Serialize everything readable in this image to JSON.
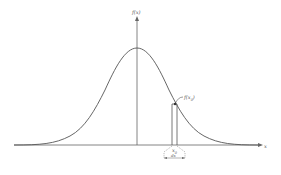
{
  "figure": {
    "type": "normal-distribution-diagram",
    "y_axis_label": "f(x)",
    "x_axis_label": "x",
    "point_label": "f(x",
    "point_label_sub": "0",
    "point_label_close": ")",
    "interval_label": "x",
    "interval_label_sub": "0",
    "width_label": "dx",
    "colors": {
      "curve": "#555555",
      "axes": "#666666",
      "background": "#ffffff"
    }
  }
}
